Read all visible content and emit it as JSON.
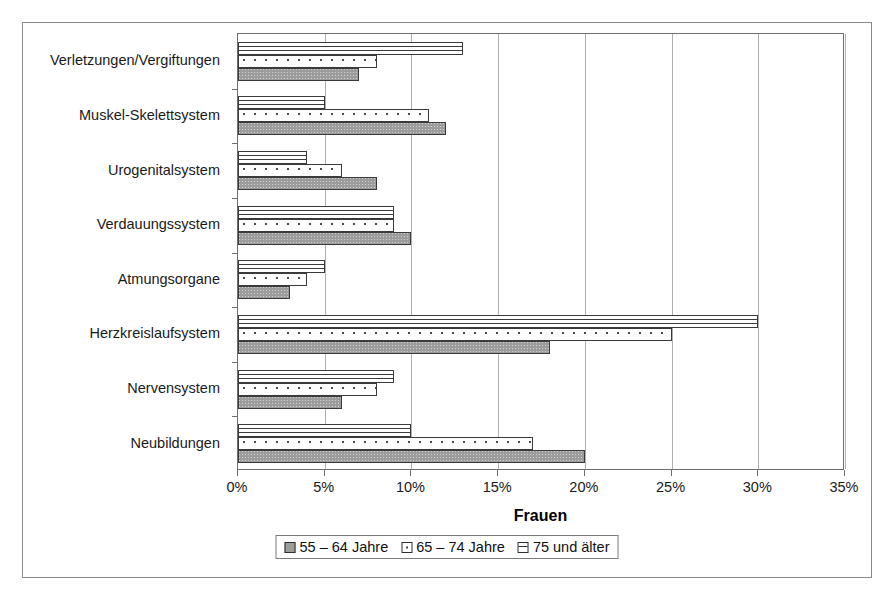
{
  "chart_data": {
    "type": "bar",
    "orientation": "horizontal",
    "title": "",
    "xlabel": "Frauen",
    "ylabel": "",
    "xlim": [
      0,
      35
    ],
    "xtick_labels": [
      "0%",
      "5%",
      "10%",
      "15%",
      "20%",
      "25%",
      "30%",
      "35%"
    ],
    "xtick_values": [
      0,
      5,
      10,
      15,
      20,
      25,
      30,
      35
    ],
    "grid": true,
    "legend_position": "bottom",
    "categories": [
      "Verletzungen/Vergiftungen",
      "Muskel-Skelettsystem",
      "Urogenitalsystem",
      "Verdauungssystem",
      "Atmungsorgane",
      "Herzkreislaufsystem",
      "Nervensystem",
      "Neubildungen"
    ],
    "series": [
      {
        "name": "55 – 64 Jahre",
        "pattern": "solid-gray",
        "values": [
          7,
          12,
          8,
          10,
          3,
          18,
          6,
          20
        ]
      },
      {
        "name": "65 – 74 Jahre",
        "pattern": "dotted-white",
        "values": [
          8,
          11,
          6,
          9,
          4,
          25,
          8,
          17
        ]
      },
      {
        "name": "75 und älter",
        "pattern": "horizontal-lines",
        "values": [
          13,
          5,
          4,
          9,
          5,
          30,
          9,
          10
        ]
      }
    ]
  },
  "legend": {
    "items": [
      {
        "label": "55 – 64 Jahre"
      },
      {
        "label": "65 – 74 Jahre"
      },
      {
        "label": "75 und älter"
      }
    ]
  },
  "colors": {
    "series_55_64": "#9c9c9c",
    "series_65_74": "#ffffff",
    "series_75_plus": "#ffffff",
    "bar_outline": "#3a3a3a",
    "gridline": "#b0b0b0",
    "plot_border": "#6e6e6e",
    "frame_border": "#8a8a8a",
    "text": "#000000",
    "background": "#ffffff"
  }
}
